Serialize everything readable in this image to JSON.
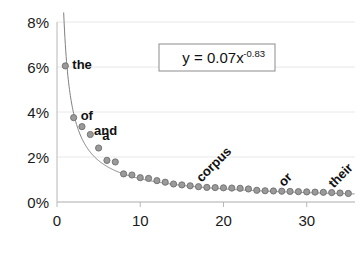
{
  "chart_data": {
    "type": "scatter",
    "title": "",
    "xlabel": "",
    "ylabel": "",
    "xlim": [
      0,
      35.8
    ],
    "ylim": [
      0,
      8
    ],
    "grid": true,
    "legend": "none",
    "y_tick_labels": [
      "0%",
      "2%",
      "4%",
      "6%",
      "8%"
    ],
    "y_tick_values": [
      0,
      2,
      4,
      6,
      8
    ],
    "x_tick_labels": [
      "0",
      "10",
      "20",
      "30"
    ],
    "x_tick_values": [
      0,
      10,
      20,
      30
    ],
    "x": [
      1,
      2,
      3,
      4,
      5,
      6,
      7,
      8,
      9,
      10,
      11,
      12,
      13,
      14,
      15,
      16,
      17,
      18,
      19,
      20,
      21,
      22,
      23,
      24,
      25,
      26,
      27,
      28,
      29,
      30,
      31,
      32,
      33,
      34,
      35
    ],
    "values": [
      6.05,
      3.75,
      3.35,
      3.0,
      2.4,
      1.85,
      1.78,
      1.25,
      1.2,
      1.08,
      1.05,
      0.95,
      0.88,
      0.8,
      0.76,
      0.72,
      0.68,
      0.65,
      0.64,
      0.63,
      0.62,
      0.61,
      0.58,
      0.52,
      0.5,
      0.49,
      0.48,
      0.47,
      0.46,
      0.45,
      0.44,
      0.43,
      0.42,
      0.4,
      0.38
    ],
    "annotations": [
      {
        "text": "the",
        "x": 1,
        "y": 6.05,
        "rotation": 0
      },
      {
        "text": "of",
        "x": 2,
        "y": 3.75,
        "rotation": 0
      },
      {
        "text": "and",
        "x": 3,
        "y": 3.35,
        "rotation": 0
      },
      {
        "text": "a",
        "x": 4,
        "y": 3.0,
        "rotation": 0
      },
      {
        "text": "corpus",
        "x": 17,
        "y": 0.68,
        "rotation": -45
      },
      {
        "text": "or",
        "x": 27,
        "y": 0.48,
        "rotation": -45
      },
      {
        "text": "their",
        "x": 33,
        "y": 0.42,
        "rotation": -45
      }
    ],
    "trendline": {
      "equation": "y = 0.07x",
      "exponent": "-0.83",
      "coefficient": 0.07,
      "power": -0.83,
      "label_full": "y = 0.07x-0.83"
    },
    "marker": {
      "fill": "#9a9a9a",
      "stroke": "#6e6e6e",
      "radius": 3.1
    },
    "colors": {
      "gridline": "#e8e8e8",
      "axis": "#b8b8b8",
      "trendline": "#808080",
      "text": "#1a1a1a",
      "box_border": "#8c8c8c",
      "background": "#ffffff"
    }
  }
}
